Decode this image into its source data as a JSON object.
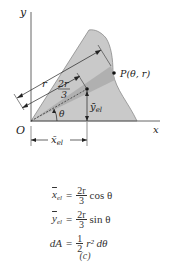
{
  "figure": {
    "axes": {
      "x_label": "x",
      "y_label": "y",
      "origin_label": "O"
    },
    "point_label": "P(θ, r)",
    "radius_label": "r",
    "two_r_over_three": {
      "num": "2r",
      "den": "3"
    },
    "angle_label": "θ",
    "xbar_label": "x̄",
    "xbar_sub": "el",
    "ybar_label": "ȳ",
    "ybar_sub": "el",
    "colors": {
      "area_fill": "#c4c4c4",
      "area_stroke": "#7a7a7a",
      "element_fill": "#a6a6a6",
      "axis": "#555555",
      "text": "#222222"
    }
  },
  "equations": [
    {
      "lhs": "x",
      "lhs_sub": "el",
      "overline": true,
      "frac_num": "2r",
      "frac_den": "3",
      "rest": "cos θ"
    },
    {
      "lhs": "y",
      "lhs_sub": "el",
      "overline": true,
      "frac_num": "2r",
      "frac_den": "3",
      "rest": "sin θ"
    },
    {
      "lhs": "dA",
      "lhs_sub": "",
      "overline": false,
      "frac_num": "1",
      "frac_den": "2",
      "rest": "r² dθ"
    }
  ],
  "caption": "(c)"
}
